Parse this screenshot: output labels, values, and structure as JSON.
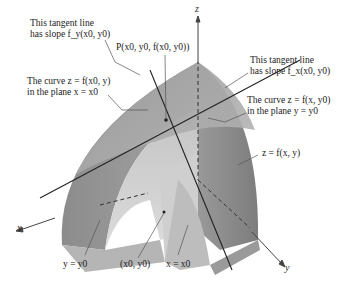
{
  "figure": {
    "axes": {
      "x": "x",
      "y": "y",
      "z": "z"
    },
    "labels": {
      "tangent_fy_line1": "This tangent line",
      "tangent_fy_line2": "has slope f_y(x0, y0)",
      "point_P": "P(x0, y0, f(x0, y0))",
      "tangent_fx_line1": "This tangent line",
      "tangent_fx_line2": "has slope f_x(x0, y0)",
      "curve_x0_line1": "The curve z = f(x0, y)",
      "curve_x0_line2": "in the plane x = x0",
      "curve_y0_line1": "The curve z = f(x, y0)",
      "curve_y0_line2": "in the plane y = y0",
      "surface": "z = f(x, y)",
      "plane_y": "y = y0",
      "base_point": "(x0, y0)",
      "plane_x": "x = x0"
    },
    "colors": {
      "surface_dark": "#8a8a8a",
      "surface_mid": "#a8a8a8",
      "surface_light": "#c8c8c8",
      "face_light": "#d6d6d6",
      "line": "#333333",
      "leader": "#555555"
    }
  }
}
